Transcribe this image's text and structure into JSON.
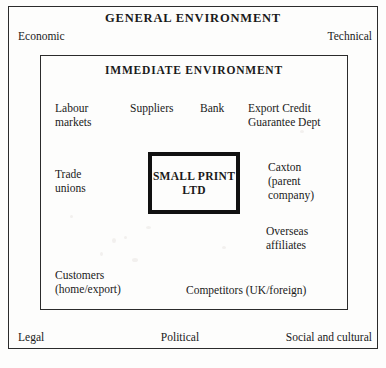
{
  "diagram": {
    "type": "nested-boxes",
    "title": "GENERAL ENVIRONMENT",
    "layers": [
      {
        "name": "general-environment",
        "label": "GENERAL ENVIRONMENT",
        "factors": [
          "Economic",
          "Technical",
          "Legal",
          "Political",
          "Social and cultural"
        ]
      },
      {
        "name": "immediate-environment",
        "label": "IMMEDIATE ENVIRONMENT",
        "factors": [
          "Labour\nmarkets",
          "Suppliers",
          "Bank",
          "Export Credit\nGuarantee Dept",
          "Trade\nunions",
          "Caxton\n(parent\ncompany)",
          "Overseas\naffiliates",
          "Customers\n(home/export)",
          "Competitors (UK/foreign)"
        ]
      },
      {
        "name": "core-organisation",
        "label": "SMALL\nPRINT LTD"
      }
    ]
  },
  "outer": {
    "heading": "GENERAL ENVIRONMENT",
    "economic": "Economic",
    "technical": "Technical",
    "legal": "Legal",
    "political": "Political",
    "social_cultural": "Social and cultural"
  },
  "inner": {
    "heading": "IMMEDIATE ENVIRONMENT",
    "labour_markets": "Labour\nmarkets",
    "suppliers": "Suppliers",
    "bank": "Bank",
    "export_credit": "Export Credit\nGuarantee Dept",
    "trade_unions": "Trade\nunions",
    "caxton": "Caxton\n(parent\ncompany)",
    "overseas_affiliates": "Overseas\naffiliates",
    "customers": "Customers\n(home/export)",
    "competitors": "Competitors (UK/foreign)"
  },
  "core": {
    "label": "SMALL\nPRINT LTD"
  },
  "colors": {
    "background": "#fdfdfc",
    "frame_stroke": "#2b2b2b",
    "core_stroke": "#111111",
    "text": "#1a1a1a"
  }
}
